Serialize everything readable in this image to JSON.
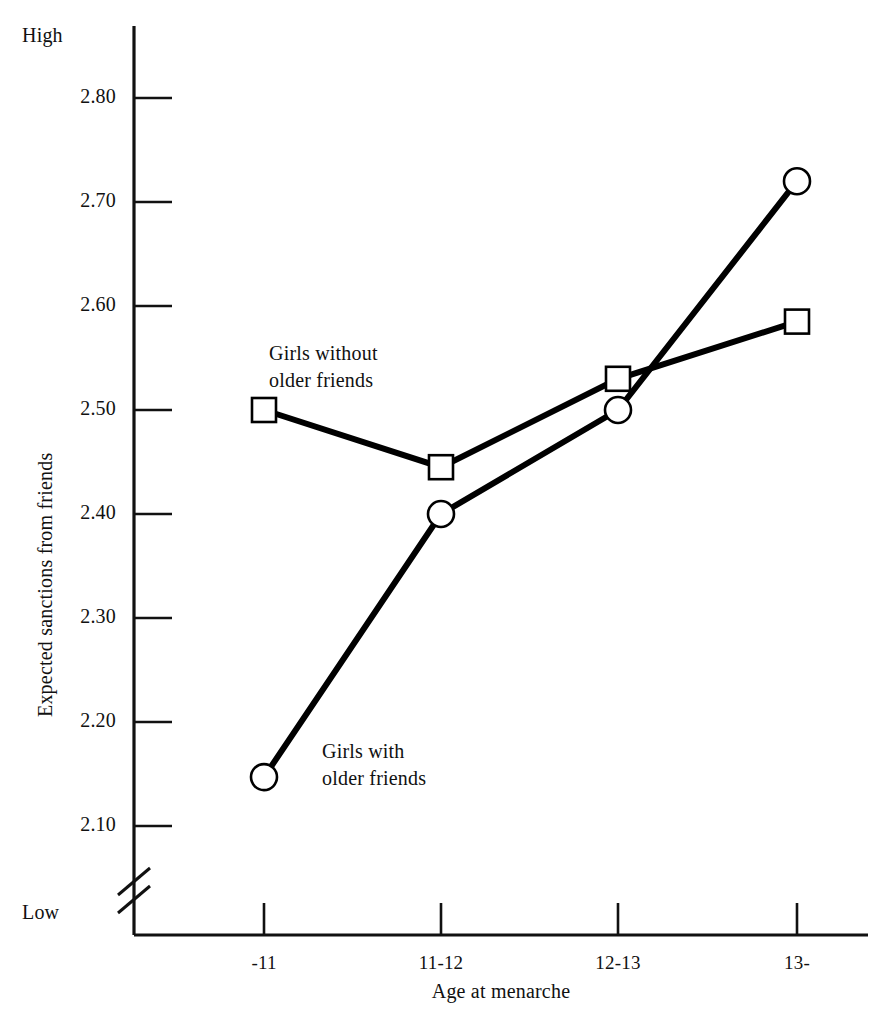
{
  "figure": {
    "background": "#ffffff",
    "ink_color": "#000000",
    "marker_fill": "#ffffff"
  },
  "axis_endpoint_labels": {
    "high": "High",
    "low": "Low"
  },
  "series_annotations": [
    {
      "id": "without",
      "text": "Girls without\nolder friends"
    },
    {
      "id": "with",
      "text": "Girls with\nolder friends"
    }
  ],
  "chart_data": {
    "type": "line",
    "title": "",
    "subtitle": "",
    "xlabel": "Age at menarche",
    "ylabel": "Expected sanctions from friends",
    "categories": [
      "-11",
      "11-12",
      "12-13",
      "13-"
    ],
    "x": [
      0,
      1,
      2,
      3
    ],
    "ylim": [
      2.05,
      2.85
    ],
    "yticks": [
      2.1,
      2.2,
      2.3,
      2.4,
      2.5,
      2.6,
      2.7,
      2.8
    ],
    "ytick_labels": [
      "2.10",
      "2.20",
      "2.30",
      "2.40",
      "2.50",
      "2.60",
      "2.70",
      "2.80"
    ],
    "y_axis_break": true,
    "y_axis_break_note": "axis break below 2.10",
    "y_axis_high_label": "High",
    "y_axis_low_label": "Low",
    "grid": false,
    "legend_position": "inline-annotations",
    "series": [
      {
        "name": "Girls without older friends",
        "marker": "open-square",
        "values": [
          2.5,
          2.445,
          2.53,
          2.585
        ]
      },
      {
        "name": "Girls with older friends",
        "marker": "open-circle",
        "values": [
          2.147,
          2.4,
          2.5,
          2.72
        ]
      }
    ]
  }
}
